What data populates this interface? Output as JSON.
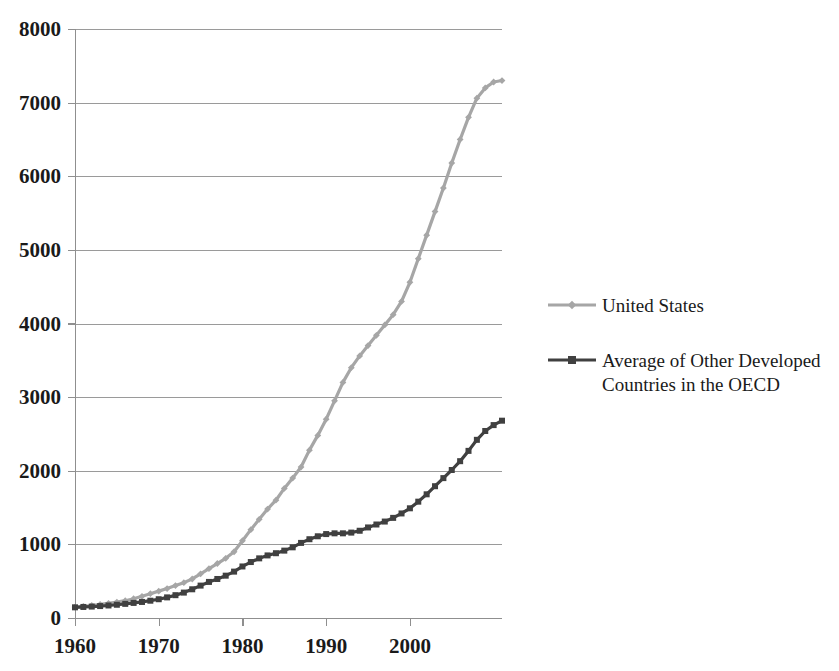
{
  "chart_data": {
    "type": "line",
    "title": "",
    "subtitle": "",
    "xlabel": "",
    "ylabel": "",
    "xlim": [
      1960,
      2011
    ],
    "ylim": [
      0,
      8000
    ],
    "grid": true,
    "legend_position": "right",
    "x": [
      1960,
      1961,
      1962,
      1963,
      1964,
      1965,
      1966,
      1967,
      1968,
      1969,
      1970,
      1971,
      1972,
      1973,
      1974,
      1975,
      1976,
      1977,
      1978,
      1979,
      1980,
      1981,
      1982,
      1983,
      1984,
      1985,
      1986,
      1987,
      1988,
      1989,
      1990,
      1991,
      1992,
      1993,
      1994,
      1995,
      1996,
      1997,
      1998,
      1999,
      2000,
      2001,
      2002,
      2003,
      2004,
      2005,
      2006,
      2007,
      2008,
      2009,
      2010,
      2011
    ],
    "xticks": [
      1960,
      1970,
      1980,
      1990,
      2000
    ],
    "xticklabels": [
      "1960",
      "1970",
      "1980",
      "1990",
      "2000"
    ],
    "yticks": [
      0,
      1000,
      2000,
      3000,
      4000,
      5000,
      6000,
      7000,
      8000
    ],
    "yticklabels": [
      "0",
      "1000",
      "2000",
      "3000",
      "4000",
      "5000",
      "6000",
      "7000",
      "8000"
    ],
    "series": [
      {
        "name": "United States",
        "color": "#a6a6a6",
        "marker": "diamond",
        "values": [
          148,
          158,
          170,
          185,
          200,
          215,
          235,
          262,
          295,
          330,
          365,
          400,
          440,
          480,
          530,
          600,
          670,
          740,
          810,
          900,
          1050,
          1200,
          1340,
          1480,
          1600,
          1760,
          1900,
          2050,
          2280,
          2480,
          2700,
          2950,
          3200,
          3400,
          3560,
          3700,
          3840,
          3980,
          4120,
          4300,
          4560,
          4880,
          5200,
          5520,
          5840,
          6180,
          6500,
          6800,
          7060,
          7200,
          7280,
          7300
        ]
      },
      {
        "name": "Average of Other Developed Countries in the OECD",
        "color": "#404040",
        "marker": "square",
        "values": [
          145,
          150,
          155,
          162,
          170,
          180,
          192,
          205,
          218,
          235,
          255,
          280,
          310,
          345,
          390,
          440,
          490,
          530,
          575,
          630,
          700,
          760,
          810,
          850,
          880,
          915,
          960,
          1020,
          1070,
          1110,
          1140,
          1150,
          1150,
          1160,
          1185,
          1230,
          1270,
          1310,
          1360,
          1420,
          1490,
          1580,
          1680,
          1790,
          1900,
          2010,
          2130,
          2270,
          2420,
          2540,
          2620,
          2680
        ]
      }
    ]
  },
  "legend": {
    "items": [
      {
        "label": "United States",
        "color": "#a6a6a6"
      },
      {
        "label": "Average of Other Developed Countries in the OECD",
        "color": "#404040"
      }
    ]
  },
  "axes": {
    "x_tick_labels": [
      "1960",
      "1970",
      "1980",
      "1990",
      "2000"
    ],
    "y_tick_labels": [
      "0",
      "1000",
      "2000",
      "3000",
      "4000",
      "5000",
      "6000",
      "7000",
      "8000"
    ]
  }
}
